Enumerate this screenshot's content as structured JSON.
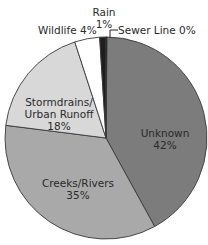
{
  "chart_data": {
    "type": "pie",
    "title": "",
    "slices": [
      {
        "label": "Unknown",
        "value": 42,
        "display": "42%",
        "color": "#7c7c7c"
      },
      {
        "label": "Creeks/Rivers",
        "value": 35,
        "display": "35%",
        "color": "#a9a9a9"
      },
      {
        "label": "Stormdrains/Urban Runoff",
        "value": 18,
        "display": "18%",
        "color": "#d8d8d8"
      },
      {
        "label": "Wildlife",
        "value": 4,
        "display": "4%",
        "color": "#ffffff"
      },
      {
        "label": "Rain",
        "value": 1,
        "display": "1%",
        "color": "#1e1e1e"
      },
      {
        "label": "Sewer Line",
        "value": 0,
        "display": "0%",
        "color": "#000000"
      }
    ],
    "legend": "none (labels on/around slices)"
  },
  "labels": {
    "unknown_name": "Unknown",
    "unknown_pct": "42%",
    "creeks_name": "Creeks/Rivers",
    "creeks_pct": "35%",
    "storm_line1": "Stormdrains/",
    "storm_line2": "Urban Runoff",
    "storm_pct": "18%",
    "wildlife": "Wildlife 4%",
    "rain_name": "Rain",
    "rain_pct": "1%",
    "sewer": "Sewer Line 0%"
  }
}
